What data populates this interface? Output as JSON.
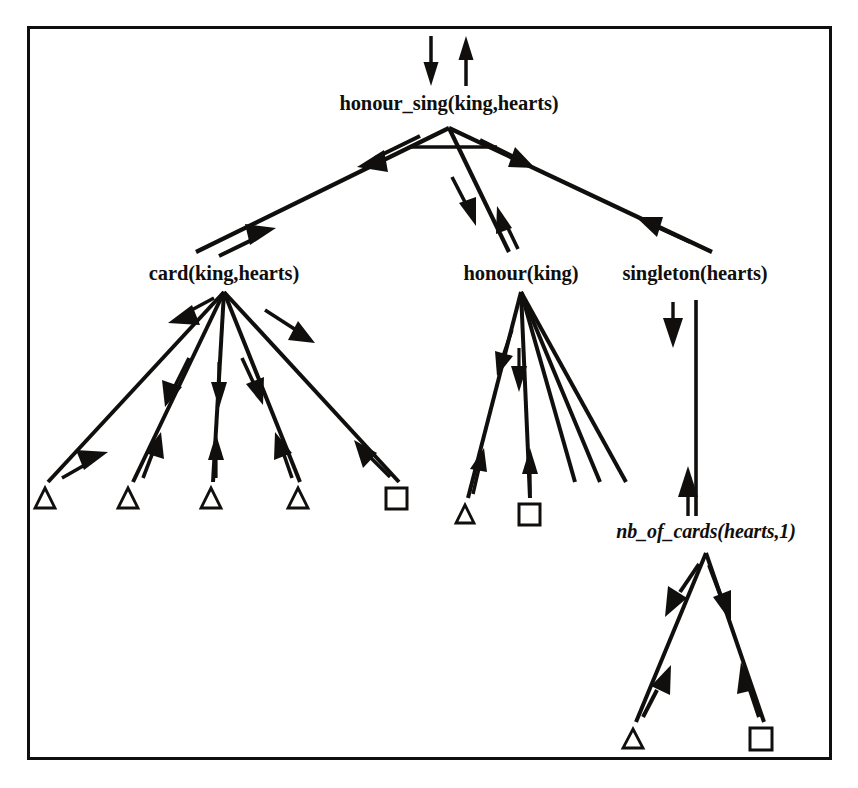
{
  "diagram": {
    "type": "and-or-proof-tree",
    "background_color": "#ffffff",
    "ink_color": "#100f0d",
    "frame": {
      "x": 27,
      "y": 26,
      "width": 805,
      "height": 734,
      "stroke_width": 3
    },
    "nodes": [
      {
        "id": "root",
        "label": "honour_sing(king,hearts)",
        "x": 449,
        "y": 103,
        "style": "bold",
        "apex_x": 449,
        "apex_y": 128
      },
      {
        "id": "card",
        "label": "card(king,hearts)",
        "x": 224,
        "y": 273,
        "style": "bold",
        "apex_x": 224,
        "apex_y": 292
      },
      {
        "id": "honour",
        "label": "honour(king)",
        "x": 521,
        "y": 273,
        "style": "bold",
        "apex_x": 521,
        "apex_y": 292
      },
      {
        "id": "singleton",
        "label": "singleton(hearts)",
        "x": 695,
        "y": 273,
        "style": "bold",
        "apex_x": 695,
        "apex_y": 292
      },
      {
        "id": "nb_of_cards",
        "label": "nb_of_cards(hearts,1)",
        "x": 706,
        "y": 531,
        "style": "italic",
        "apex_x": 706,
        "apex_y": 553
      }
    ],
    "leaves": [
      {
        "id": "leaf-card-1",
        "shape": "triangle",
        "x": 45,
        "y": 500,
        "parent": "card"
      },
      {
        "id": "leaf-card-2",
        "shape": "triangle",
        "x": 128,
        "y": 500,
        "parent": "card"
      },
      {
        "id": "leaf-card-3",
        "shape": "triangle",
        "x": 211,
        "y": 500,
        "parent": "card"
      },
      {
        "id": "leaf-card-4",
        "shape": "triangle",
        "x": 298,
        "y": 500,
        "parent": "card"
      },
      {
        "id": "leaf-card-5",
        "shape": "square",
        "x": 397,
        "y": 500,
        "parent": "card"
      },
      {
        "id": "leaf-honour-1",
        "shape": "triangle",
        "x": 465,
        "y": 516,
        "parent": "honour"
      },
      {
        "id": "leaf-honour-2",
        "shape": "square",
        "x": 530,
        "y": 516,
        "parent": "honour"
      },
      {
        "id": "leaf-nb-1",
        "shape": "triangle",
        "x": 633,
        "y": 739,
        "parent": "nb_of_cards"
      },
      {
        "id": "leaf-nb-2",
        "shape": "square",
        "x": 761,
        "y": 739,
        "parent": "nb_of_cards"
      }
    ],
    "edges": [
      {
        "id": "e-top-in",
        "from": "above",
        "to": "root",
        "x1": 431,
        "y1": 36,
        "x2": 431,
        "y2": 82,
        "arrows": "down"
      },
      {
        "id": "e-top-out",
        "from": "root",
        "to": "above",
        "x1": 466,
        "y1": 82,
        "x2": 466,
        "y2": 36,
        "arrows": "up"
      },
      {
        "id": "e-root-card",
        "from": "root",
        "to": "card",
        "x1": 449,
        "y1": 128,
        "x2": 196,
        "y2": 252,
        "arrows": "both"
      },
      {
        "id": "e-root-honour",
        "from": "root",
        "to": "honour",
        "x1": 449,
        "y1": 128,
        "x2": 509,
        "y2": 252,
        "arrows": "both"
      },
      {
        "id": "e-root-singleton",
        "from": "root",
        "to": "singleton",
        "x1": 449,
        "y1": 128,
        "x2": 712,
        "y2": 252,
        "arrows": "both"
      },
      {
        "id": "e-card-1",
        "from": "card",
        "to": "leaf-card-1",
        "x1": 224,
        "y1": 292,
        "x2": 48,
        "y2": 482,
        "arrows": "both"
      },
      {
        "id": "e-card-2",
        "from": "card",
        "to": "leaf-card-2",
        "x1": 224,
        "y1": 292,
        "x2": 133,
        "y2": 482,
        "arrows": "both"
      },
      {
        "id": "e-card-3",
        "from": "card",
        "to": "leaf-card-3",
        "x1": 224,
        "y1": 292,
        "x2": 213,
        "y2": 482,
        "arrows": "both"
      },
      {
        "id": "e-card-4",
        "from": "card",
        "to": "leaf-card-4",
        "x1": 224,
        "y1": 292,
        "x2": 300,
        "y2": 482,
        "arrows": "both"
      },
      {
        "id": "e-card-5",
        "from": "card",
        "to": "leaf-card-5",
        "x1": 224,
        "y1": 292,
        "x2": 399,
        "y2": 482,
        "arrows": "both"
      },
      {
        "id": "e-honour-1",
        "from": "honour",
        "to": "leaf-honour-1",
        "x1": 521,
        "y1": 292,
        "x2": 468,
        "y2": 498,
        "arrows": "both"
      },
      {
        "id": "e-honour-2",
        "from": "honour",
        "to": "leaf-honour-2",
        "x1": 521,
        "y1": 292,
        "x2": 530,
        "y2": 498,
        "arrows": "both"
      },
      {
        "id": "e-honour-3",
        "from": "honour",
        "to": "open-a",
        "x1": 521,
        "y1": 292,
        "x2": 575,
        "y2": 482,
        "arrows": "none"
      },
      {
        "id": "e-honour-4",
        "from": "honour",
        "to": "open-b",
        "x1": 521,
        "y1": 292,
        "x2": 600,
        "y2": 482,
        "arrows": "none"
      },
      {
        "id": "e-honour-5",
        "from": "honour",
        "to": "open-c",
        "x1": 521,
        "y1": 292,
        "x2": 626,
        "y2": 482,
        "arrows": "none"
      },
      {
        "id": "e-singleton-nb",
        "from": "singleton",
        "to": "nb_of_cards",
        "x1": 696,
        "y1": 300,
        "x2": 696,
        "y2": 516,
        "arrows": "both"
      },
      {
        "id": "e-nb-1",
        "from": "nb_of_cards",
        "to": "leaf-nb-1",
        "x1": 706,
        "y1": 553,
        "x2": 636,
        "y2": 722,
        "arrows": "both"
      },
      {
        "id": "e-nb-2",
        "from": "nb_of_cards",
        "to": "leaf-nb-2",
        "x1": 706,
        "y1": 553,
        "x2": 764,
        "y2": 722,
        "arrows": "both"
      }
    ],
    "and_bar": {
      "id": "root-and-bar",
      "x1": 409,
      "y1": 147,
      "x2": 497,
      "y2": 147
    }
  }
}
